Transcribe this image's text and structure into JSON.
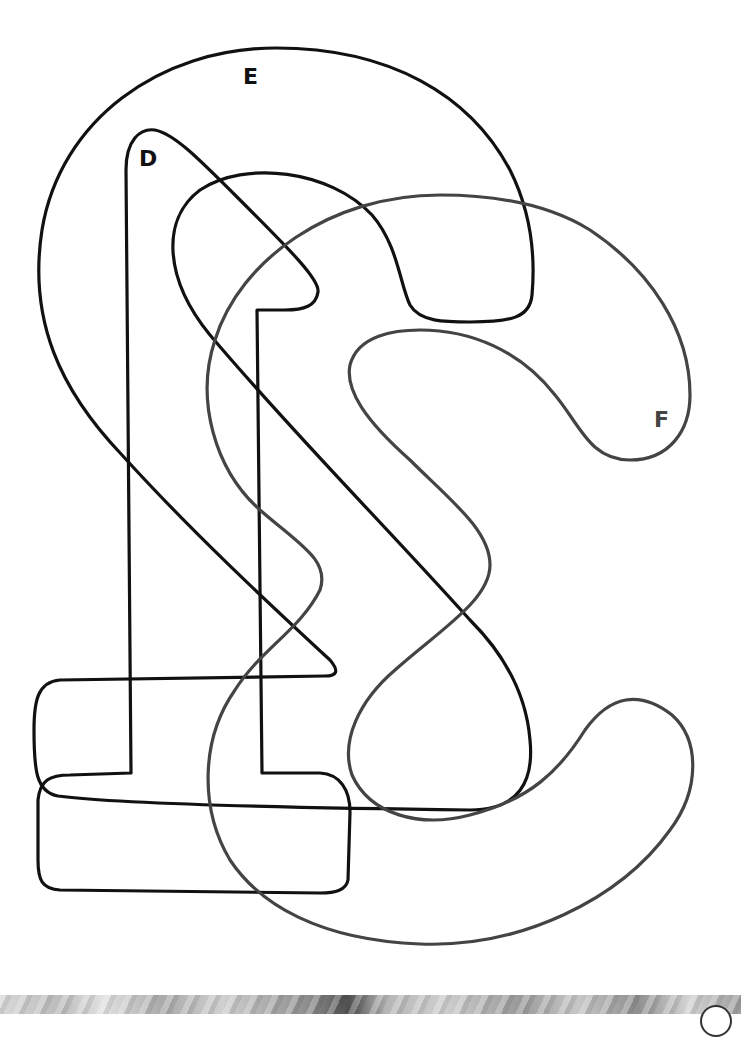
{
  "diagram": {
    "type": "overlapping closed outlines (set diagram)",
    "shapes": [
      {
        "id": "E",
        "label": "E",
        "stroke": "#111111",
        "description": "large '2'-shaped outline"
      },
      {
        "id": "D",
        "label": "D",
        "stroke": "#111111",
        "description": "tall '£'-shaped outline with base"
      },
      {
        "id": "F",
        "label": "F",
        "stroke": "#444444",
        "description": "'S'/'C'-shaped curling outline"
      }
    ],
    "labels": {
      "e": "E",
      "d": "D",
      "f": "F"
    }
  },
  "footer": {
    "pattern": "decorative grayscale textured strip"
  }
}
